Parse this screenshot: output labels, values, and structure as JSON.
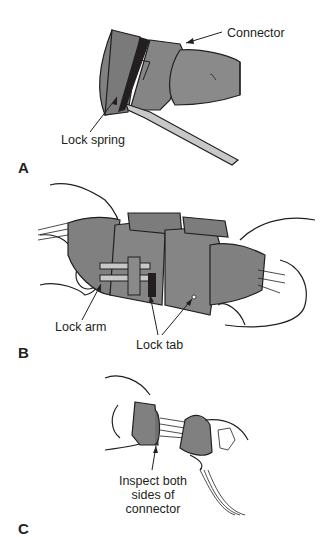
{
  "figure": {
    "panels": [
      {
        "letter": "A",
        "callouts": [
          {
            "id": "connector",
            "text": "Connector"
          },
          {
            "id": "lock-spring",
            "text": "Lock spring"
          }
        ]
      },
      {
        "letter": "B",
        "callouts": [
          {
            "id": "lock-arm",
            "text": "Lock arm"
          },
          {
            "id": "lock-tab",
            "text": "Lock tab"
          }
        ]
      },
      {
        "letter": "C",
        "callouts": [
          {
            "id": "inspect",
            "lines": [
              "Inspect both",
              "sides of",
              "connector"
            ]
          }
        ]
      }
    ],
    "colors": {
      "fill_gray": "#808080",
      "fill_light": "#c8c8c8",
      "line": "#231f20",
      "background": "#ffffff"
    }
  }
}
